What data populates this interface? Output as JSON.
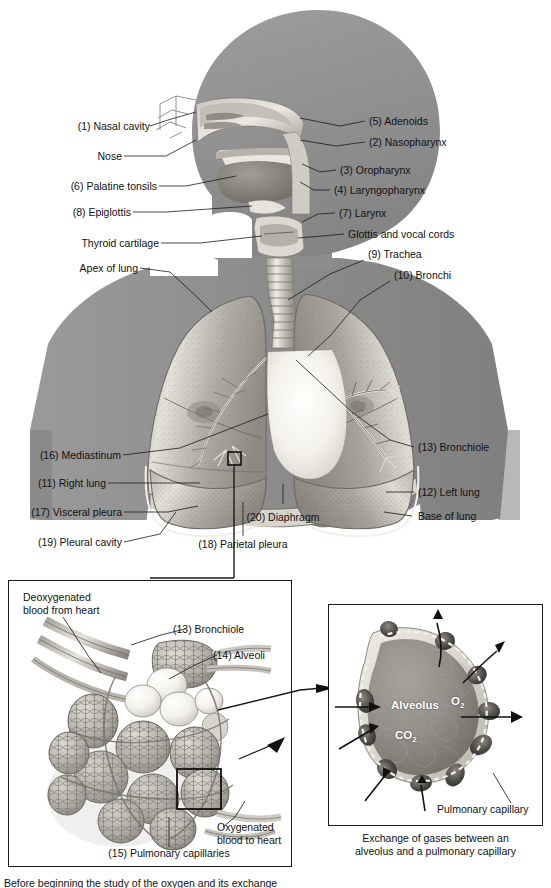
{
  "figure": {
    "background": "#ffffff",
    "silhouette_color": "#8e8e8e",
    "line_color": "#1a1a1a"
  },
  "main_diagram": {
    "labels_left": [
      {
        "id": "1",
        "text": "(1) Nasal cavity"
      },
      {
        "id": "",
        "text": "Nose"
      },
      {
        "id": "6",
        "text": "(6) Palatine tonsils"
      },
      {
        "id": "8",
        "text": "(8) Epiglottis"
      },
      {
        "id": "",
        "text": "Thyroid cartilage"
      },
      {
        "id": "",
        "text": "Apex of lung"
      },
      {
        "id": "16",
        "text": "(16) Mediastinum"
      },
      {
        "id": "11",
        "text": "(11) Right lung"
      },
      {
        "id": "17",
        "text": "(17) Visceral pleura"
      },
      {
        "id": "19",
        "text": "(19) Pleural cavity"
      }
    ],
    "labels_right": [
      {
        "id": "5",
        "text": "(5) Adenoids"
      },
      {
        "id": "2",
        "text": "(2) Nasopharynx"
      },
      {
        "id": "3",
        "text": "(3) Oropharynx"
      },
      {
        "id": "4",
        "text": "(4) Laryngopharynx"
      },
      {
        "id": "7",
        "text": "(7) Larynx"
      },
      {
        "id": "",
        "text": "Glottis and vocal cords"
      },
      {
        "id": "9",
        "text": "(9) Trachea"
      },
      {
        "id": "10",
        "text": "(10) Bronchi"
      },
      {
        "id": "13",
        "text": "(13) Bronchiole"
      },
      {
        "id": "12",
        "text": "(12) Left lung"
      },
      {
        "id": "",
        "text": "Base of lung"
      }
    ],
    "labels_center": [
      {
        "id": "18",
        "text": "(18) Parietal pleura"
      },
      {
        "id": "20",
        "text": "(20) Diaphragm"
      }
    ]
  },
  "panel_alveoli": {
    "labels": [
      {
        "id": "",
        "text_line1": "Deoxygenated",
        "text_line2": "blood from heart"
      },
      {
        "id": "13",
        "text": "(13) Bronchiole"
      },
      {
        "id": "14",
        "text": "(14) Alveoli"
      },
      {
        "id": "",
        "text_line1": "Oxygenated",
        "text_line2": "blood to heart"
      },
      {
        "id": "15",
        "text": "(15) Pulmonary capillaries"
      }
    ]
  },
  "panel_gas_exchange": {
    "inner_labels": [
      {
        "text": "Alveolus"
      },
      {
        "text": "O",
        "sub": "2"
      },
      {
        "text": "CO",
        "sub": "2"
      }
    ],
    "callout": "Pulmonary capillary",
    "caption_line1": "Exchange of gases between an",
    "caption_line2": "alveolus and a pulmonary capillary"
  },
  "bottom_caption": {
    "text": "Before beginning the study of the oxygen and its exchange"
  }
}
